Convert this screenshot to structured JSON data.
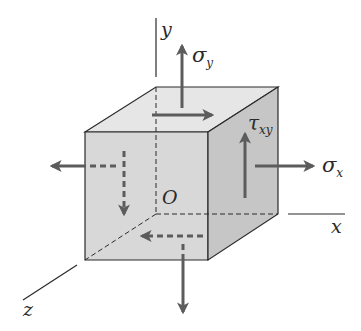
{
  "diagram": {
    "title": "",
    "axes": {
      "x_label": "x",
      "y_label": "y",
      "z_label": "z",
      "origin_label": "O"
    },
    "stresses": {
      "sigma_x": {
        "symbol": "σ",
        "subscript": "x"
      },
      "sigma_y": {
        "symbol": "σ",
        "subscript": "y"
      },
      "tau_xy": {
        "symbol": "τ",
        "subscript": "xy"
      }
    },
    "colors": {
      "top_face": "#e6e6e6",
      "front_face": "#d8d8d8",
      "right_face": "#c6c6c6",
      "edge": "#2a2a2a",
      "arrow": "#5c5c5c",
      "axis": "#2a2a2a"
    }
  }
}
